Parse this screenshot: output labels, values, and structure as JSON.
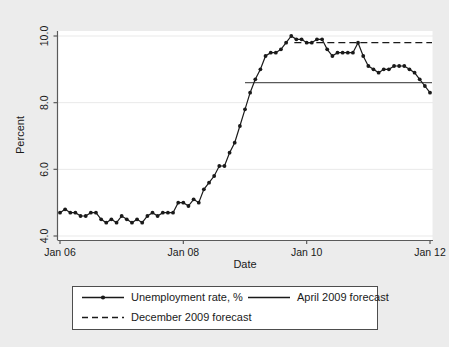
{
  "chart_data": {
    "type": "line",
    "title": "",
    "xlabel": "Date",
    "ylabel": "Percent",
    "ylim": [
      4.0,
      10.0
    ],
    "xlim": [
      "Jan 06",
      "Jan 12"
    ],
    "grid": true,
    "y_ticks": [
      "4.0",
      "6.0",
      "8.0",
      "10.0"
    ],
    "y_tick_values": [
      4.0,
      6.0,
      8.0,
      10.0
    ],
    "x_ticks": [
      "Jan 06",
      "Jan 08",
      "Jan 10",
      "Jan 12"
    ],
    "x_tick_values": [
      2006.0,
      2008.0,
      2010.0,
      2012.0
    ],
    "legend_position": "below-plot",
    "series": [
      {
        "name": "Unemployment rate, %",
        "style": "solid-with-markers",
        "color": "#1a1a1a",
        "x": [
          2006.0,
          2006.083,
          2006.167,
          2006.25,
          2006.333,
          2006.417,
          2006.5,
          2006.583,
          2006.667,
          2006.75,
          2006.833,
          2006.917,
          2007.0,
          2007.083,
          2007.167,
          2007.25,
          2007.333,
          2007.417,
          2007.5,
          2007.583,
          2007.667,
          2007.75,
          2007.833,
          2007.917,
          2008.0,
          2008.083,
          2008.167,
          2008.25,
          2008.333,
          2008.417,
          2008.5,
          2008.583,
          2008.667,
          2008.75,
          2008.833,
          2008.917,
          2009.0,
          2009.083,
          2009.167,
          2009.25,
          2009.333,
          2009.417,
          2009.5,
          2009.583,
          2009.667,
          2009.75,
          2009.833,
          2009.917,
          2010.0,
          2010.083,
          2010.167,
          2010.25,
          2010.333,
          2010.417,
          2010.5,
          2010.583,
          2010.667,
          2010.75,
          2010.833,
          2010.917,
          2011.0,
          2011.083,
          2011.167,
          2011.25,
          2011.333,
          2011.417,
          2011.5,
          2011.583,
          2011.667,
          2011.75,
          2011.833,
          2011.917,
          2012.0
        ],
        "values": [
          4.7,
          4.8,
          4.7,
          4.7,
          4.6,
          4.6,
          4.7,
          4.7,
          4.5,
          4.4,
          4.5,
          4.4,
          4.6,
          4.5,
          4.4,
          4.5,
          4.4,
          4.6,
          4.7,
          4.6,
          4.7,
          4.7,
          4.7,
          5.0,
          5.0,
          4.9,
          5.1,
          5.0,
          5.4,
          5.6,
          5.8,
          6.1,
          6.1,
          6.5,
          6.8,
          7.3,
          7.8,
          8.3,
          8.7,
          9.0,
          9.4,
          9.5,
          9.5,
          9.6,
          9.8,
          10.0,
          9.9,
          9.9,
          9.8,
          9.8,
          9.9,
          9.9,
          9.6,
          9.4,
          9.5,
          9.5,
          9.5,
          9.5,
          9.8,
          9.4,
          9.1,
          9.0,
          8.9,
          9.0,
          9.0,
          9.1,
          9.1,
          9.1,
          9.0,
          8.9,
          8.7,
          8.5,
          8.3
        ]
      },
      {
        "name": "April 2009 forecast",
        "style": "solid",
        "color": "#4d4d4d",
        "type": "horizontal-line",
        "value": 8.6,
        "x_start": 2009.0,
        "x_end": 2012.0
      },
      {
        "name": "December 2009 forecast",
        "style": "dashed",
        "color": "#1a1a1a",
        "type": "horizontal-line",
        "value": 9.8,
        "x_start": 2009.8,
        "x_end": 2012.0
      }
    ]
  },
  "legend": {
    "entries": [
      {
        "label": "Unemployment rate, %",
        "style": "solid-with-marker"
      },
      {
        "label": "April 2009 forecast",
        "style": "solid"
      },
      {
        "label": "December 2009 forecast",
        "style": "dashed"
      }
    ]
  },
  "axis": {
    "ylabel": "Percent",
    "xlabel": "Date",
    "y_ticks": [
      "4.0",
      "6.0",
      "8.0",
      "10.0"
    ],
    "x_ticks": [
      "Jan 06",
      "Jan 08",
      "Jan 10",
      "Jan 12"
    ]
  },
  "colors": {
    "background": "#ececec",
    "plot_background": "#ffffff",
    "series_line": "#1a1a1a",
    "gridline": "#e8e8e8",
    "axis": "#4d4d4d",
    "forecast_april": "#4d4d4d"
  }
}
